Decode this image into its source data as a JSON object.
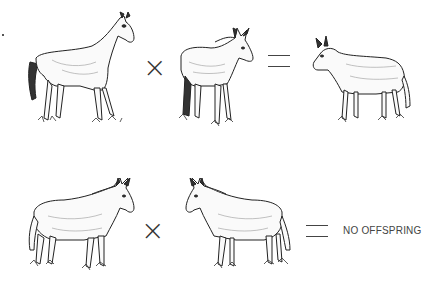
{
  "diagram": {
    "rows": [
      {
        "left": {
          "animal": "horse",
          "facing": "right"
        },
        "operator1": "×",
        "right": {
          "animal": "donkey",
          "facing": "right"
        },
        "operator2": "=",
        "result": {
          "animal": "mule",
          "facing": "left"
        }
      },
      {
        "left": {
          "animal": "mule",
          "facing": "right"
        },
        "operator1": "×",
        "right": {
          "animal": "mule",
          "facing": "left"
        },
        "operator2": "=",
        "result_text": "NO OFFSPRING"
      }
    ]
  }
}
